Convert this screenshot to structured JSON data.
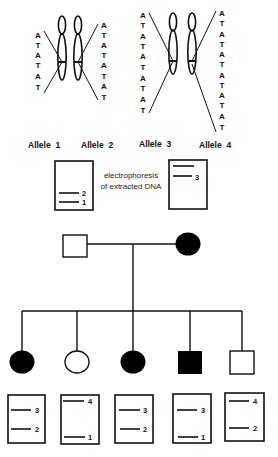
{
  "alleles": [
    {
      "label": "Allele  1",
      "repeat": "ATATAT",
      "letters": [
        "A",
        "T",
        "A",
        "T",
        "A",
        "T"
      ]
    },
    {
      "label": "Allele  2",
      "repeat": "ATATATAT",
      "letters": [
        "A",
        "T",
        "A",
        "T",
        "A",
        "T",
        "A",
        "T"
      ]
    },
    {
      "label": "Allele  3",
      "repeat": "ATATATATAT",
      "letters": [
        "A",
        "T",
        "A",
        "T",
        "A",
        "T",
        "A",
        "T",
        "A",
        "T"
      ]
    },
    {
      "label": "Allele  4",
      "repeat": "ATATATATATAT",
      "letters": [
        "A",
        "T",
        "A",
        "T",
        "A",
        "T",
        "A",
        "T",
        "A",
        "T",
        "A",
        "T"
      ]
    }
  ],
  "electrophoresis_note": [
    "electrophoresis",
    "of extracted DNA"
  ],
  "parent_gels": {
    "father": {
      "bands": [
        "2",
        "1"
      ]
    },
    "mother": {
      "bands": [
        "",
        "3"
      ]
    }
  },
  "pedigree": {
    "parents": [
      {
        "role": "father",
        "sex": "male",
        "affected": false
      },
      {
        "role": "mother",
        "sex": "female",
        "affected": true
      }
    ],
    "children": [
      {
        "sex": "female",
        "affected": true,
        "gel_bands": [
          "3",
          "2"
        ]
      },
      {
        "sex": "female",
        "affected": false,
        "gel_bands": [
          "4",
          "1"
        ]
      },
      {
        "sex": "female",
        "affected": true,
        "gel_bands": [
          "3",
          "2"
        ]
      },
      {
        "sex": "male",
        "affected": true,
        "gel_bands": [
          "3",
          "1"
        ]
      },
      {
        "sex": "male",
        "affected": false,
        "gel_bands": [
          "4",
          "2"
        ]
      }
    ]
  }
}
